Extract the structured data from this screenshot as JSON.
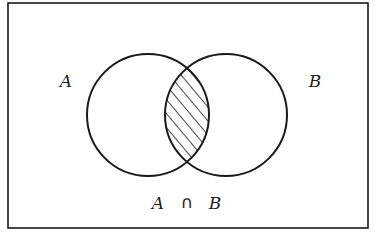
{
  "diagram": {
    "type": "venn",
    "colors": {
      "background": "#ffffff",
      "stroke": "#1a1a1a",
      "text": "#222222",
      "hatch": "#1a1a1a"
    },
    "frame": {
      "x": 8,
      "y": 3,
      "width": 360,
      "height": 225
    },
    "sets": [
      {
        "id": "A",
        "label": "A",
        "cx": 148,
        "cy": 115,
        "r": 61,
        "label_x": 66,
        "label_y": 87
      },
      {
        "id": "B",
        "label": "B",
        "cx": 226,
        "cy": 115,
        "r": 61,
        "label_x": 315,
        "label_y": 87
      }
    ],
    "highlighted_region": {
      "name": "intersection",
      "fill": "hatched"
    },
    "caption": {
      "left": "A",
      "operator": "∩",
      "right": "B"
    }
  }
}
